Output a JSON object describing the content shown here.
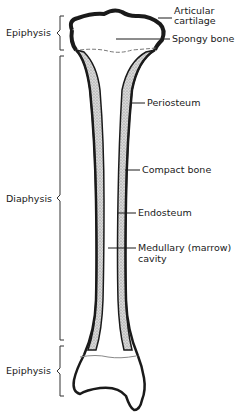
{
  "diagram": {
    "region_labels": {
      "epiphysis_top": "Epiphysis",
      "diaphysis": "Diaphysis",
      "epiphysis_bottom": "Epiphysis"
    },
    "structure_labels": {
      "articular_cartilage_line1": "Articular",
      "articular_cartilage_line2": "cartilage",
      "spongy_bone": "Spongy bone",
      "periosteum": "Periosteum",
      "compact_bone": "Compact bone",
      "endosteum": "Endosteum",
      "medullary_line1": "Medullary (marrow)",
      "medullary_line2": "cavity"
    },
    "colors": {
      "outline": "#1a1a1a",
      "stipple": "#bdbdbd",
      "background": "#ffffff"
    }
  }
}
